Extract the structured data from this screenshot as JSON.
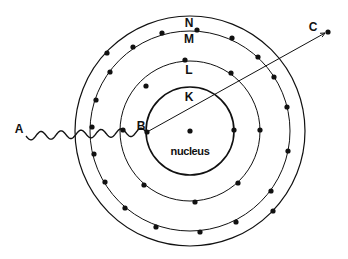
{
  "diagram": {
    "type": "bohr-atom-photoelectric",
    "center": [
      190,
      131
    ],
    "nucleus": {
      "label": "nucleus",
      "position": [
        190,
        131
      ]
    },
    "shells": [
      {
        "name": "K",
        "radius": 44,
        "stroke_width": 1.6,
        "label_pos": [
          189,
          101
        ],
        "electrons": [
          [
            147,
            132
          ],
          [
            234,
            130
          ]
        ]
      },
      {
        "name": "L",
        "radius": 70,
        "stroke_width": 1.0,
        "label_pos": [
          189,
          74
        ],
        "electrons": [
          [
            185,
            60
          ],
          [
            231,
            73
          ],
          [
            146,
            86
          ],
          [
            123,
            130
          ],
          [
            260,
            130
          ],
          [
            144,
            185
          ],
          [
            238,
            183
          ],
          [
            195,
            202
          ]
        ]
      },
      {
        "name": "M",
        "radius": 100,
        "stroke_width": 1.0,
        "label_pos": [
          189,
          43
        ],
        "electrons": [
          [
            197,
            30
          ],
          [
            162,
            33
          ],
          [
            232,
            38
          ],
          [
            133,
            47
          ],
          [
            258,
            57
          ],
          [
            110,
            72
          ],
          [
            274,
            77
          ],
          [
            96,
            100
          ],
          [
            287,
            107
          ],
          [
            92,
            127
          ],
          [
            94,
            154
          ],
          [
            288,
            151
          ],
          [
            105,
            182
          ],
          [
            271,
            191
          ],
          [
            125,
            208
          ],
          [
            236,
            222
          ],
          [
            156,
            227
          ],
          [
            200,
            232
          ]
        ]
      },
      {
        "name": "N",
        "radius": 115,
        "stroke_width": 1.2,
        "label_pos": [
          189,
          27
        ],
        "electrons": [
          [
            107,
            53
          ],
          [
            273,
            211
          ]
        ]
      }
    ],
    "points": {
      "A": {
        "label": "A",
        "label_pos": [
          19,
          133
        ]
      },
      "B": {
        "label": "B",
        "label_pos": [
          141,
          130
        ],
        "position": [
          147,
          132
        ]
      },
      "C": {
        "label": "C",
        "label_pos": [
          313,
          31
        ],
        "position": [
          328,
          32
        ]
      }
    },
    "incoming_wave": {
      "from": [
        26,
        136
      ],
      "to": [
        147,
        132
      ],
      "wavelength": 20,
      "amplitude": 4
    },
    "ejected_path": {
      "from": [
        147,
        132
      ],
      "to": [
        325,
        33
      ],
      "arrowhead": true
    },
    "colors": {
      "ink": "#111111",
      "background": "#ffffff"
    }
  }
}
